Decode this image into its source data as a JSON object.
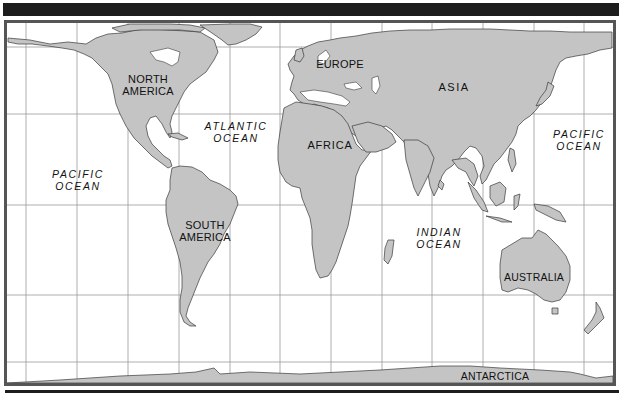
{
  "map": {
    "type": "world-political-outline",
    "land_color": "#c4c4c4",
    "water_color": "#ffffff",
    "frame_color": "#555555",
    "bar_color": "#1d1d1d",
    "continents": [
      {
        "id": "north-america",
        "label": "NORTH\nAMERICA"
      },
      {
        "id": "south-america",
        "label": "SOUTH\nAMERICA"
      },
      {
        "id": "europe",
        "label": "EUROPE"
      },
      {
        "id": "asia",
        "label": "ASIA"
      },
      {
        "id": "africa",
        "label": "AFRICA"
      },
      {
        "id": "australia",
        "label": "AUSTRALIA"
      },
      {
        "id": "antarctica",
        "label": "ANTARCTICA"
      }
    ],
    "oceans": [
      {
        "id": "atlantic",
        "label": "ATLANTIC\nOCEAN"
      },
      {
        "id": "pacific-west",
        "label": "PACIFIC\nOCEAN"
      },
      {
        "id": "pacific-east",
        "label": "PACIFIC\nOCEAN"
      },
      {
        "id": "indian",
        "label": "INDIAN\nOCEAN"
      }
    ]
  }
}
